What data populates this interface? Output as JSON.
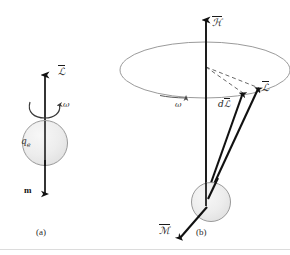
{
  "figure": {
    "background": "#ffffff",
    "ink": "#1a1a1a",
    "sphere_fill": "#ececec",
    "sphere_stroke": "#8c8c8c",
    "ellipse_stroke": "#8a8a8a",
    "dashed_stroke": "#555555",
    "rule_color": "#d8d8d8",
    "width": 290,
    "height": 255
  },
  "panel_a": {
    "caption": "(a)",
    "angular_momentum_label": "ℒ",
    "angular_velocity_label": "ω",
    "charge_label": "q",
    "charge_subscript": "e",
    "magnetic_moment_label": "m",
    "sphere": {
      "cx": 45,
      "cy": 143,
      "r": 22
    },
    "axis_arrow": {
      "x": 45,
      "y_top": 73,
      "y_bottom": 143
    },
    "moment_arrow": {
      "x": 45,
      "y_top": 143,
      "y_bottom": 196
    }
  },
  "panel_b": {
    "caption": "(b)",
    "field_label": "ℋ",
    "angular_velocity_label": "ω",
    "angular_momentum_label": "ℒ",
    "increment_label_prefix": "d",
    "increment_label": "ℒ",
    "magnetic_moment_label": "ℳ",
    "sphere": {
      "cx": 211,
      "cy": 202,
      "r": 19
    },
    "precession_ellipse": {
      "cx": 205,
      "cy": 70,
      "rx": 85,
      "ry": 28
    },
    "field_axis": {
      "x": 206,
      "y_top": 18,
      "y_bottom": 204
    },
    "L_vector": {
      "x1": 207,
      "y1": 196,
      "x2": 259,
      "y2": 88
    },
    "dL_vector": {
      "x1": 205,
      "y1": 196,
      "x2": 243,
      "y2": 93
    }
  }
}
